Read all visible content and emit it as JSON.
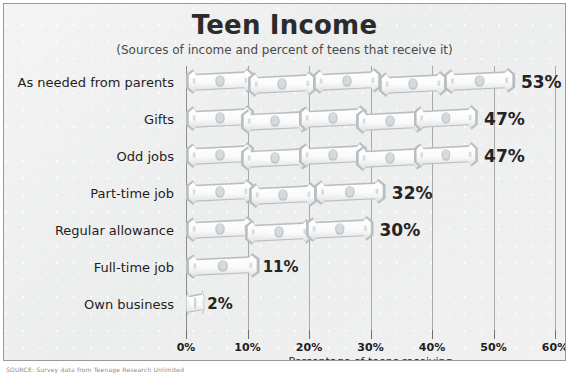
{
  "chart_data": {
    "type": "bar",
    "orientation": "horizontal",
    "title": "Teen Income",
    "subtitle": "(Sources of income and percent of teens that receive it)",
    "xlabel": "Percentage of teens receiving",
    "ylabel": "",
    "xlim": [
      0,
      60
    ],
    "xticks": [
      0,
      10,
      20,
      30,
      40,
      50,
      60
    ],
    "xticklabels": [
      "0%",
      "10%",
      "20%",
      "30%",
      "40%",
      "50%",
      "60%"
    ],
    "grid": "vertical",
    "legend": "none",
    "bar_style": "dollar-bill pictograph",
    "categories": [
      "As needed from parents",
      "Gifts",
      "Odd jobs",
      "Part-time job",
      "Regular allowance",
      "Full-time job",
      "Own business"
    ],
    "values": [
      53,
      47,
      47,
      32,
      30,
      11,
      2
    ],
    "value_labels": [
      "53%",
      "47%",
      "47%",
      "32%",
      "30%",
      "11%",
      "2%"
    ]
  },
  "footer": {
    "source": "SOURCE: Survey data from Teenage Research Unlimited"
  },
  "colors": {
    "frame_border": "#9a9a9a",
    "panel_background": "#f0f0f0",
    "gridline": "#a9a9a9",
    "text": "#1e1e1e",
    "bill_fill": "#fbfbfb",
    "bill_shade": "#b9bec2"
  }
}
